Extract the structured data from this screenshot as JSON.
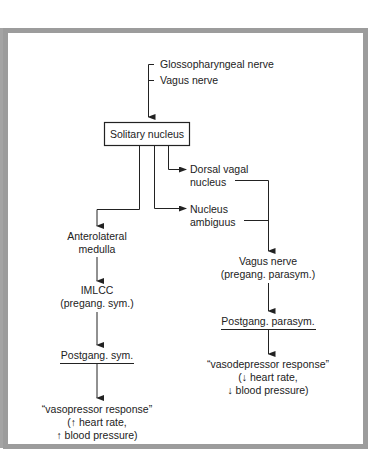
{
  "diagram": {
    "colors": {
      "frame": "#9c9c9c",
      "ink": "#222222",
      "background": "#ffffff"
    },
    "inputs": [
      "Glossopharyngeal nerve",
      "Vagus nerve"
    ],
    "center": "Solitary nucleus",
    "right_branch_nuclei": [
      [
        "Dorsal vagal",
        "nucleus"
      ],
      [
        "Nucleus",
        "ambiguus"
      ]
    ],
    "left_chain": {
      "step1": [
        "Anterolateral",
        "medulla"
      ],
      "step2": [
        "IMLCC",
        "(pregang. sym.)"
      ],
      "step3": "Postgang. sym.",
      "result": [
        "“vasopressor response”",
        "(↑ heart rate,",
        "↑ blood pressure)"
      ]
    },
    "right_chain": {
      "step1": [
        "Vagus nerve",
        "(pregang. parasym.)"
      ],
      "step2": "Postgang. parasym.",
      "result": [
        "“vasodepressor response”",
        "(↓ heart rate,",
        "↓ blood pressure)"
      ]
    }
  }
}
